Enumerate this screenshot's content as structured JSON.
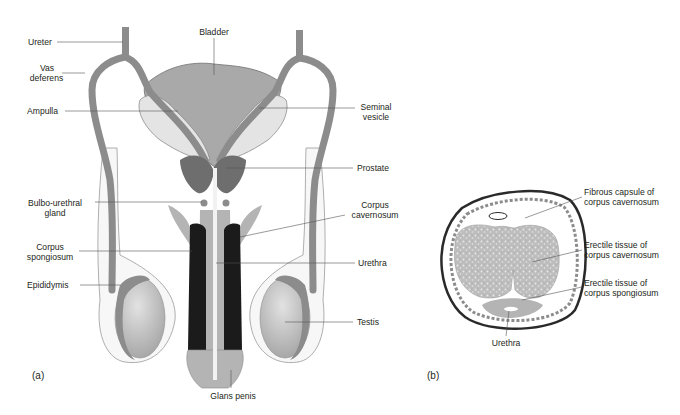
{
  "figure": {
    "panels": [
      {
        "id": "a",
        "label": "(a)",
        "title": "Male reproductive system, frontal view"
      },
      {
        "id": "b",
        "label": "(b)",
        "title": "Penis, transverse section"
      }
    ]
  },
  "panel_a": {
    "labels": {
      "ureter": "Ureter",
      "vas_deferens_1": "Vas",
      "vas_deferens_2": "deferens",
      "ampulla": "Ampulla",
      "bladder": "Bladder",
      "seminal_vesicle_1": "Seminal",
      "seminal_vesicle_2": "vesicle",
      "prostate": "Prostate",
      "bulbo_1": "Bulbo-urethral",
      "bulbo_2": "gland",
      "corpus_cav_1": "Corpus",
      "corpus_cav_2": "cavernosum",
      "corpus_spong_1": "Corpus",
      "corpus_spong_2": "spongiosum",
      "urethra": "Urethra",
      "epididymis": "Epididymis",
      "testis": "Testis",
      "glans": "Glans penis"
    }
  },
  "panel_b": {
    "labels": {
      "fibrous_1": "Fibrous capsule of",
      "fibrous_2": "corpus cavernosum",
      "erectile_cav_1": "Erectile tissue of",
      "erectile_cav_2": "corpus cavernosum",
      "erectile_spong_1": "Erectile tissue of",
      "erectile_spong_2": "corpus spongiosum",
      "urethra": "Urethra"
    }
  },
  "colors": {
    "duct": "#8c8c8c",
    "bladder": "#a9a9a9",
    "vesicle": "#e4e4e4",
    "prostate": "#6e6e6e",
    "cavernosum": "#1b1b1b",
    "spongiosum": "#b4b4b4",
    "testis": "#c2c2c2",
    "leader": "#555555"
  }
}
